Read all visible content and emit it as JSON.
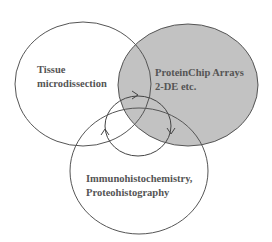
{
  "diagram": {
    "type": "venn",
    "circles": [
      {
        "id": "tissue",
        "label_lines": [
          "Tissue",
          "microdissection"
        ],
        "fill": "#ffffff"
      },
      {
        "id": "proteinchip",
        "label_lines": [
          "ProteinChip Arrays",
          "2-DE etc."
        ],
        "fill": "#c2c2c2"
      },
      {
        "id": "immuno",
        "label_lines": [
          "Immunohistochemistry,",
          "Proteohistography"
        ],
        "fill": "none"
      }
    ],
    "cycle": {
      "description": "small central circle with three clockwise arrowheads linking the three methods",
      "arrow_count": 3
    },
    "colors": {
      "stroke": "#555555",
      "gray_fill": "#c2c2c2",
      "text": "#555555"
    }
  }
}
